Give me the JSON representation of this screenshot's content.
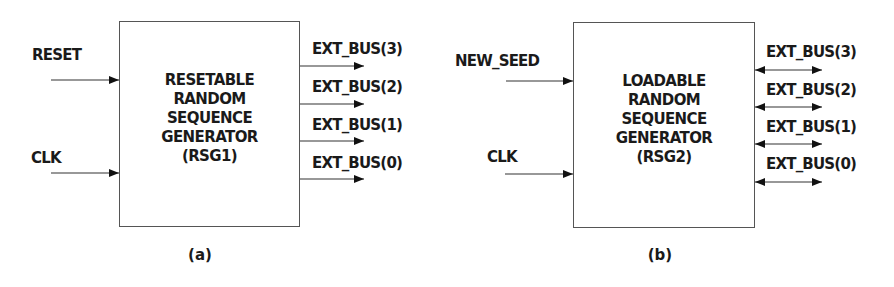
{
  "figure": {
    "panels": [
      {
        "id": "a",
        "caption": "(a)",
        "block": {
          "lines": [
            "RESETABLE",
            "RANDOM",
            "SEQUENCE",
            "GENERATOR",
            "(RSG1)"
          ]
        },
        "inputs": [
          "RESET",
          "CLK"
        ],
        "outputs": [
          "EXT_BUS(3)",
          "EXT_BUS(2)",
          "EXT_BUS(1)",
          "EXT_BUS(0)"
        ],
        "output_direction": "out"
      },
      {
        "id": "b",
        "caption": "(b)",
        "block": {
          "lines": [
            "LOADABLE",
            "RANDOM",
            "SEQUENCE",
            "GENERATOR",
            "(RSG2)"
          ]
        },
        "inputs": [
          "NEW_SEED",
          "CLK"
        ],
        "outputs": [
          "EXT_BUS(3)",
          "EXT_BUS(2)",
          "EXT_BUS(1)",
          "EXT_BUS(0)"
        ],
        "output_direction": "bidirectional"
      }
    ]
  },
  "colors": {
    "text": "#1a1a1a",
    "box_border": "#555555",
    "wire": "#333333",
    "background": "#ffffff"
  }
}
